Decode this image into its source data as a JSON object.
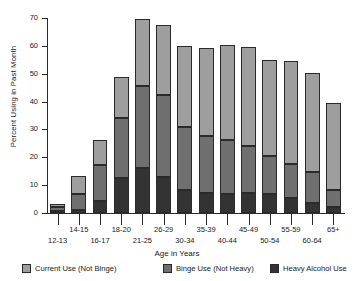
{
  "chart_data": {
    "type": "bar",
    "stacked": true,
    "title": "",
    "xlabel": "Age in Years",
    "ylabel": "Percent Using in Past Month",
    "ylim": [
      0,
      70
    ],
    "yticks": [
      0,
      10,
      20,
      30,
      40,
      50,
      60,
      70
    ],
    "grid": false,
    "legend_position": "bottom",
    "categories": [
      "12-13",
      "14-15",
      "16-17",
      "18-20",
      "21-25",
      "26-29",
      "30-34",
      "35-39",
      "40-44",
      "45-49",
      "50-54",
      "55-59",
      "60-64",
      "65+"
    ],
    "series": [
      {
        "name": "Heavy Alcohol Use",
        "color": "#333333",
        "values": [
          0.3,
          1.2,
          4.4,
          12.4,
          16.0,
          13.1,
          8.2,
          7.3,
          7.0,
          7.3,
          6.7,
          5.3,
          3.7,
          2.2
        ]
      },
      {
        "name": "Binge Use (Not Heavy)",
        "color": "#6f6f6f",
        "values": [
          1.8,
          5.8,
          13.0,
          21.6,
          29.7,
          29.4,
          22.8,
          20.2,
          19.2,
          16.7,
          13.6,
          12.4,
          11.0,
          6.0
        ]
      },
      {
        "name": "Current Use (Not Binge)",
        "color": "#9e9e9e",
        "values": [
          1.2,
          6.2,
          8.9,
          14.9,
          23.9,
          25.0,
          28.9,
          31.9,
          34.1,
          35.5,
          34.5,
          37.0,
          35.5,
          31.4
        ]
      }
    ],
    "totals": [
      3.3,
      13.2,
      26.3,
      48.9,
      69.6,
      67.5,
      59.9,
      59.4,
      60.3,
      59.5,
      54.8,
      54.7,
      50.2,
      39.6
    ]
  },
  "legend": {
    "items": [
      {
        "label": "Current Use (Not Binge)",
        "color": "#9e9e9e"
      },
      {
        "label": "Binge Use (Not Heavy)",
        "color": "#6f6f6f"
      },
      {
        "label": "Heavy Alcohol Use",
        "color": "#333333"
      }
    ]
  }
}
